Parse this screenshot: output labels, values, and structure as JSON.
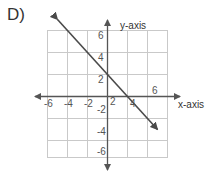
{
  "choice": {
    "label": "D)"
  },
  "axes": {
    "x_label": "x-axis",
    "y_label": "y-axis",
    "x_ticks": [
      "-6",
      "-4",
      "-2",
      "2",
      "4",
      "6"
    ],
    "y_ticks": [
      "6",
      "4",
      "2",
      "-2",
      "-4",
      "-6"
    ]
  },
  "colors": {
    "grid": "#c9c9c9",
    "axis": "#555555",
    "line": "#4a4a4a",
    "text": "#333333",
    "background": "#ffffff"
  },
  "chart_data": {
    "type": "line",
    "title": "",
    "xlabel": "x-axis",
    "ylabel": "y-axis",
    "xlim": [
      -7,
      7
    ],
    "ylim": [
      -7,
      7
    ],
    "grid": true,
    "grid_step": 2,
    "xticks": [
      -6,
      -4,
      -2,
      2,
      4,
      6
    ],
    "yticks": [
      -6,
      -4,
      -2,
      2,
      4,
      6
    ],
    "legend": "none",
    "series": [
      {
        "name": "line",
        "equation": "y = -x + 2",
        "slope": -1,
        "intercept": 2,
        "x": [
          -5,
          5
        ],
        "values": [
          7,
          -3
        ],
        "arrows": "both"
      }
    ]
  }
}
